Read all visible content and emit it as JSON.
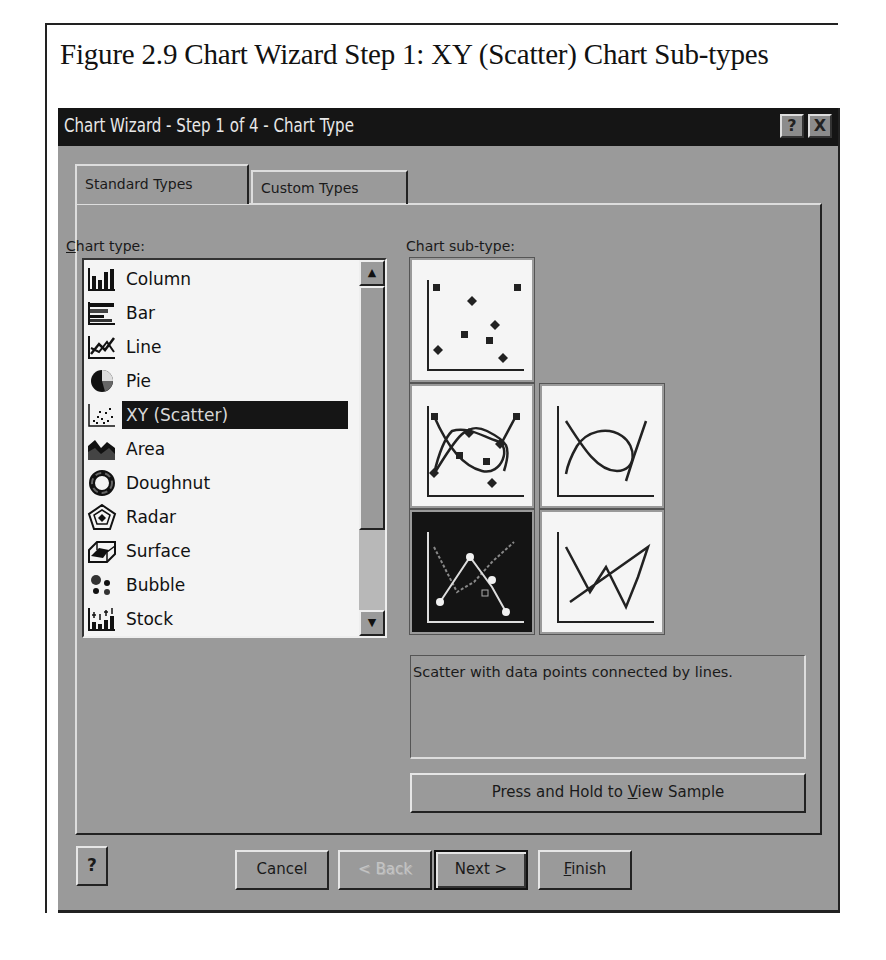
{
  "caption": "Figure 2.9  Chart Wizard Step 1: XY (Scatter) Chart Sub-types",
  "dialog": {
    "title": "Chart Wizard - Step 1 of 4 - Chart Type",
    "titlebar_buttons": {
      "help": "?",
      "close": "X"
    },
    "tabs": [
      {
        "label": "Standard Types",
        "active": true
      },
      {
        "label": "Custom Types",
        "active": false
      }
    ],
    "chart_type_label": "Chart type:",
    "chart_type_label_mnemonic": "C",
    "chart_type_label_rest": "hart type:",
    "chart_subtype_label": "Chart sub-type:",
    "chart_types": [
      {
        "label": "Column",
        "icon": "column-chart-icon"
      },
      {
        "label": "Bar",
        "icon": "bar-chart-icon"
      },
      {
        "label": "Line",
        "icon": "line-chart-icon"
      },
      {
        "label": "Pie",
        "icon": "pie-chart-icon"
      },
      {
        "label": "XY (Scatter)",
        "icon": "scatter-chart-icon",
        "selected": true
      },
      {
        "label": "Area",
        "icon": "area-chart-icon"
      },
      {
        "label": "Doughnut",
        "icon": "doughnut-chart-icon"
      },
      {
        "label": "Radar",
        "icon": "radar-chart-icon"
      },
      {
        "label": "Surface",
        "icon": "surface-chart-icon"
      },
      {
        "label": "Bubble",
        "icon": "bubble-chart-icon"
      },
      {
        "label": "Stock",
        "icon": "stock-chart-icon"
      }
    ],
    "subtypes": [
      {
        "name": "scatter-markers-only"
      },
      {
        "name": "scatter-smoothed-lines-markers"
      },
      {
        "name": "scatter-smoothed-lines"
      },
      {
        "name": "scatter-lines-markers",
        "selected": true
      },
      {
        "name": "scatter-lines"
      }
    ],
    "description": "Scatter with data points connected by lines.",
    "sample_button": {
      "pre": "Press and Hold to ",
      "mnemonic": "V",
      "post": "iew Sample"
    },
    "buttons": {
      "help": "?",
      "cancel": "Cancel",
      "back": "< Back",
      "next": "Next >",
      "finish_mnemonic": "F",
      "finish_rest": "inish"
    }
  }
}
